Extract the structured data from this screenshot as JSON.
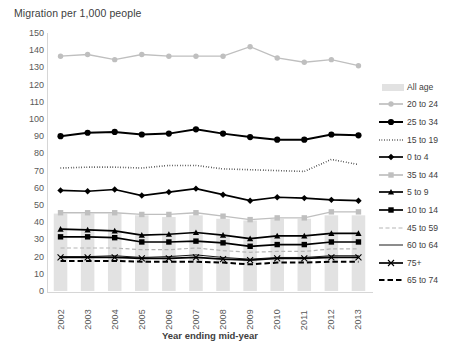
{
  "chart_data": {
    "type": "line",
    "title": "Migration per 1,000 people",
    "xlabel": "Year ending mid-year",
    "ylabel": "",
    "ylim": [
      0,
      150
    ],
    "ytick_step": 10,
    "grid": false,
    "legend_position": "right",
    "categories": [
      "2002",
      "2003",
      "2004",
      "2005",
      "2006",
      "2007",
      "2008",
      "2009",
      "2010",
      "2011",
      "2012",
      "2013"
    ],
    "yticks": [
      "0",
      "10",
      "20",
      "30",
      "40",
      "50",
      "60",
      "70",
      "80",
      "90",
      "100",
      "110",
      "120",
      "130",
      "140",
      "150"
    ],
    "series": [
      {
        "name": "All age",
        "style": "bar",
        "color": "#e2e2e2",
        "values": [
          45,
          45,
          45,
          44,
          43,
          44,
          42,
          41,
          42,
          42,
          44,
          44
        ]
      },
      {
        "name": "20 to 24",
        "style": "line-marker-circle",
        "color": "#bfbfbf",
        "values": [
          136.5,
          137.5,
          134.5,
          137.5,
          136.5,
          136.5,
          136.5,
          142,
          135.5,
          133,
          134.5,
          131
        ]
      },
      {
        "name": "25 to 34",
        "style": "line-marker-circle-bold",
        "color": "#000000",
        "values": [
          90,
          92,
          92.5,
          91,
          91.5,
          94,
          91.5,
          89.5,
          88,
          88,
          91,
          90.5
        ]
      },
      {
        "name": "15 to 19",
        "style": "dotted",
        "color": "#000000",
        "values": [
          71.5,
          72,
          72,
          71.5,
          73,
          73,
          71,
          70.5,
          70,
          69.5,
          76.5,
          73.5
        ]
      },
      {
        "name": "0 to 4",
        "style": "line-marker-diamond",
        "color": "#000000",
        "values": [
          58.5,
          58,
          59,
          55.5,
          57.5,
          59.5,
          56,
          52.5,
          54.5,
          54,
          53,
          52.5
        ]
      },
      {
        "name": "35 to 44",
        "style": "line-marker-square-gray",
        "color": "#bfbfbf",
        "values": [
          45.5,
          45.5,
          45.5,
          44.5,
          44.5,
          45.5,
          43.5,
          41.5,
          42.5,
          42.5,
          46,
          46
        ]
      },
      {
        "name": "5 to 9",
        "style": "line-marker-triangle",
        "color": "#000000",
        "values": [
          36,
          35.5,
          35,
          32.5,
          33,
          34,
          32.5,
          30.5,
          32,
          32,
          33.5,
          33.5
        ]
      },
      {
        "name": "10 to 14",
        "style": "line-marker-square",
        "color": "#000000",
        "values": [
          31.5,
          31.5,
          31,
          28.5,
          28.5,
          29,
          28,
          26,
          27,
          27,
          28.5,
          28.5
        ]
      },
      {
        "name": "45 to 59",
        "style": "dashed-gray",
        "color": "#b5b5b5",
        "values": [
          25,
          25,
          25,
          24,
          24,
          25,
          23.5,
          22.5,
          23,
          23,
          24.5,
          24.5
        ]
      },
      {
        "name": "60 to 64",
        "style": "thin-solid",
        "color": "#000000",
        "values": [
          20,
          20,
          20.5,
          19.5,
          20,
          21,
          19.5,
          18.5,
          19.5,
          19.5,
          20.5,
          20.5
        ]
      },
      {
        "name": "75+",
        "style": "line-marker-x",
        "color": "#000000",
        "values": [
          19.5,
          19.5,
          19.5,
          19,
          19,
          19.5,
          18.5,
          18,
          19,
          19,
          19.5,
          19.5
        ]
      },
      {
        "name": "65 to 74",
        "style": "dashed-bold",
        "color": "#000000",
        "values": [
          17.5,
          17.5,
          17.5,
          17,
          17,
          17,
          16.5,
          15.5,
          16.5,
          16.5,
          17,
          17
        ]
      }
    ]
  }
}
